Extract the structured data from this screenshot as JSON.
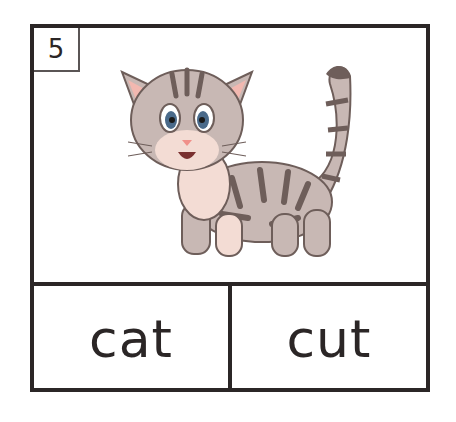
{
  "card": {
    "number": "5",
    "picture": "cat-illustration",
    "options": [
      {
        "label": "cat"
      },
      {
        "label": "cut"
      }
    ]
  },
  "colors": {
    "border": "#2b2626",
    "fur": "#c8b8b4",
    "stripes": "#6e5e5a",
    "belly": "#f3dcd4",
    "ear_inner": "#f2b8b0"
  }
}
